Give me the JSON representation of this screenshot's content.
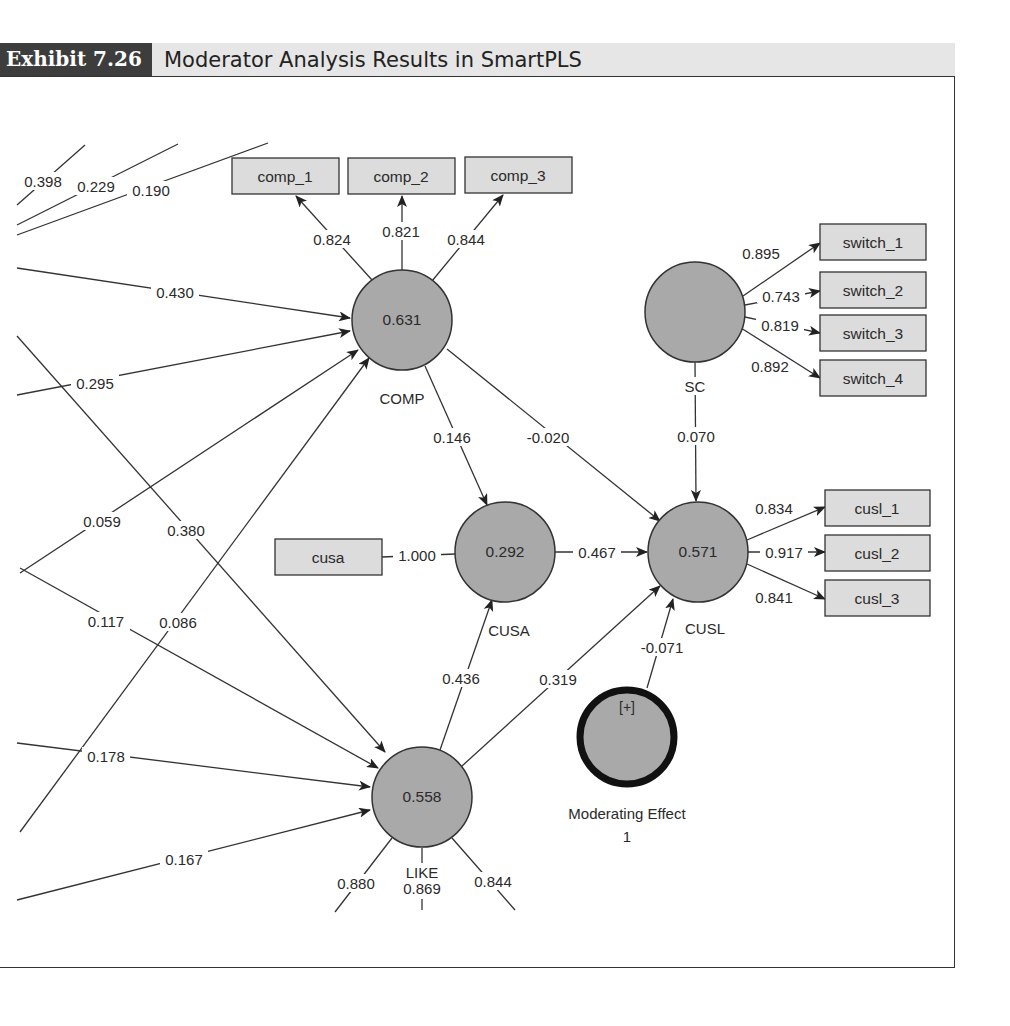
{
  "header": {
    "exhibit_label": "Exhibit 7.26",
    "title": "Moderator Analysis Results in SmartPLS"
  },
  "colors": {
    "header_dark": "#3d3d3d",
    "header_light": "#e6e6e6",
    "latent_fill": "#a9a9a9",
    "indicator_fill": "#dcdcdc",
    "line": "#333333"
  },
  "latent": {
    "comp": {
      "name": "COMP",
      "r2": "0.631"
    },
    "sc": {
      "name": "SC",
      "r2": ""
    },
    "cusa": {
      "name": "CUSA",
      "r2": "0.292"
    },
    "cusl": {
      "name": "CUSL",
      "r2": "0.571"
    },
    "like": {
      "name": "LIKE",
      "r2": "0.558"
    },
    "mod": {
      "name_line1": "Moderating Effect",
      "name_line2": "1",
      "expand": "[+]"
    }
  },
  "indicators": {
    "comp_1": "comp_1",
    "comp_2": "comp_2",
    "comp_3": "comp_3",
    "switch_1": "switch_1",
    "switch_2": "switch_2",
    "switch_3": "switch_3",
    "switch_4": "switch_4",
    "cusa": "cusa",
    "cusl_1": "cusl_1",
    "cusl_2": "cusl_2",
    "cusl_3": "cusl_3"
  },
  "loadings": {
    "comp_1": "0.824",
    "comp_2": "0.821",
    "comp_3": "0.844",
    "switch_1": "0.895",
    "switch_2": "0.743",
    "switch_3": "0.819",
    "switch_4": "0.892",
    "cusa": "1.000",
    "cusl_1": "0.834",
    "cusl_2": "0.917",
    "cusl_3": "0.841",
    "like_1": "0.880",
    "like_2": "0.869",
    "like_3": "0.844"
  },
  "paths": {
    "comp_cusa": "0.146",
    "comp_cusl": "-0.020",
    "sc_cusl": "0.070",
    "cusa_cusl": "0.467",
    "like_cusa": "0.436",
    "like_cusl": "0.319",
    "mod_cusl": "-0.071",
    "ext_398": "0.398",
    "ext_229": "0.229",
    "ext_190": "0.190",
    "ext_430": "0.430",
    "ext_295": "0.295",
    "ext_059": "0.059",
    "ext_380": "0.380",
    "ext_117": "0.117",
    "ext_086": "0.086",
    "ext_178": "0.178",
    "ext_167": "0.167"
  }
}
